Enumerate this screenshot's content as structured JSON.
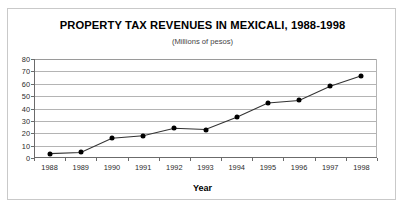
{
  "chart_data": {
    "type": "line",
    "title": "PROPERTY TAX REVENUES IN MEXICALI, 1988-1998",
    "subtitle": "(Millions of pesos)",
    "xlabel": "Year",
    "ylabel": "",
    "categories": [
      "1988",
      "1989",
      "1990",
      "1991",
      "1992",
      "1993",
      "1994",
      "1995",
      "1996",
      "1997",
      "1998"
    ],
    "values": [
      3.5,
      4.5,
      16,
      18,
      24,
      23,
      33,
      44.5,
      46.5,
      58,
      66.5
    ],
    "yticks": [
      0,
      10,
      20,
      30,
      40,
      50,
      60,
      70,
      80
    ],
    "ylim": [
      0,
      80
    ],
    "grid": "horizontal",
    "legend": "none",
    "marker": "filled-circle",
    "line_color": "#333333",
    "marker_color": "#000000",
    "grid_color": "#b4b4b4",
    "axis_color": "#6b6b6b",
    "background": "#ffffff"
  },
  "page": {
    "caption_fragment": ""
  }
}
